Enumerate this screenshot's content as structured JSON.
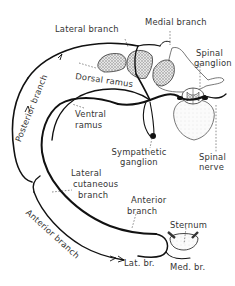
{
  "diagram": {
    "colors": {
      "line": "#111111",
      "muscle_fill": "#cfcfcf",
      "bone_outline": "#444444",
      "label": "#333333",
      "background": "#ffffff"
    },
    "labels": {
      "lateral_branch": "Lateral branch",
      "medial_branch": "Medial branch",
      "spinal_ganglion_1": "Spinal",
      "spinal_ganglion_2": "ganglion",
      "dorsal_ramus": "Dorsal ramus",
      "ventral_ramus_1": "Ventral",
      "ventral_ramus_2": "ramus",
      "posterior_branch": "Posterior branch",
      "sympathetic_ganglion_1": "Sympathetic",
      "sympathetic_ganglion_2": "ganglion",
      "spinal_nerve_1": "Spinal",
      "spinal_nerve_2": "nerve",
      "lateral_cutaneous_1": "Lateral",
      "lateral_cutaneous_2": "cutaneous",
      "lateral_cutaneous_3": "branch",
      "anterior_branch_upper_1": "Anterior",
      "anterior_branch_upper_2": "branch",
      "sternum": "Sternum",
      "anterior_branch_curved": "Anterior branch",
      "lat_br": "Lat. br.",
      "med_br": "Med. br."
    }
  }
}
